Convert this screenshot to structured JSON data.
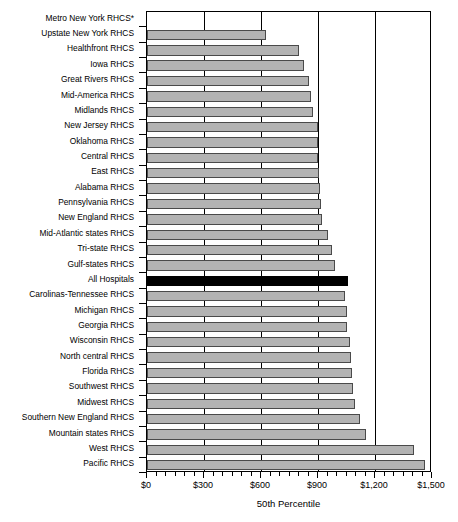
{
  "chart_data": {
    "type": "bar",
    "orientation": "horizontal",
    "title": "",
    "xlabel": "50th Percentile",
    "ylabel": "",
    "xlim": [
      0,
      1500
    ],
    "xticks": [
      0,
      300,
      600,
      900,
      1200,
      1500
    ],
    "xticklabels": [
      "$0",
      "$300",
      "$600",
      "$900",
      "$1,200",
      "$1,500"
    ],
    "minor_tick_interval": 50,
    "grid": "vertical-major",
    "legend": "none",
    "highlight_category": "All Hospitals",
    "highlight_color": "#000000",
    "bar_color": "#b3b3b3",
    "bar_edge_color": "#4a4a4a",
    "note": "Metro New York RHCS* has no bar displayed",
    "categories": [
      "Metro New York RHCS*",
      "Upstate New York RHCS",
      "Healthfront RHCS",
      "Iowa RHCS",
      "Great Rivers RHCS",
      "Mid-America RHCS",
      "Midlands RHCS",
      "New Jersey RHCS",
      "Oklahoma RHCS",
      "Central RHCS",
      "East RHCS",
      "Alabama RHCS",
      "Pennsylvania RHCS",
      "New England RHCS",
      "Mid-Atlantic states RHCS",
      "Tri-state RHCS",
      "Gulf-states RHCS",
      "All Hospitals",
      "Carolinas-Tennessee RHCS",
      "Michigan RHCS",
      "Georgia RHCS",
      "Wisconsin RHCS",
      "North central RHCS",
      "Florida RHCS",
      "Southwest RHCS",
      "Midwest RHCS",
      "Southern New England RHCS",
      "Mountain states RHCS",
      "West RHCS",
      "Pacific RHCS"
    ],
    "values": [
      0,
      625,
      800,
      825,
      850,
      865,
      875,
      900,
      900,
      900,
      905,
      910,
      915,
      920,
      950,
      975,
      990,
      1060,
      1040,
      1050,
      1055,
      1070,
      1075,
      1080,
      1085,
      1095,
      1120,
      1155,
      1405,
      1465
    ]
  }
}
